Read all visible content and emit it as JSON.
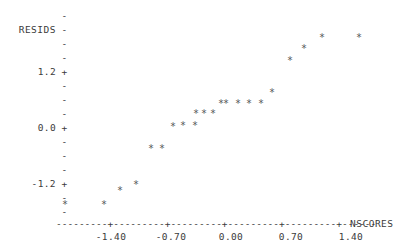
{
  "plot": {
    "y_axis_title": "RESIDS",
    "x_axis_title": "NSCORES",
    "y_tick_labels": [
      {
        "text": "1.2+",
        "value": 1.2
      },
      {
        "text": "0.0+",
        "value": 0.0
      },
      {
        "text": "-1.2+",
        "value": -1.2
      }
    ],
    "y_minor_tick_glyph": "-",
    "x_tick_labels": [
      "-1.40",
      "-0.70",
      "0.00",
      "0.70",
      "1.40"
    ],
    "x_axis_glyph_line": "---------+---------+---------+---------+---------+------",
    "x_tick_glyph": "+",
    "point_glyph": "*",
    "point_color": "#555555",
    "axis_color": "#3b3b3b",
    "background": "#ffffff",
    "n_points": 25
  },
  "chart_data": {
    "type": "scatter",
    "title": "",
    "subtitle": "",
    "xlabel": "NSCORES",
    "ylabel": "RESIDS",
    "xlim": [
      -2.1,
      2.1
    ],
    "ylim": [
      -2.3,
      2.1
    ],
    "xticks": [
      -1.4,
      -0.7,
      0.0,
      0.7,
      1.4
    ],
    "xticklabels": [
      "-1.40",
      "-0.70",
      "0.00",
      "0.70",
      "1.40"
    ],
    "yticks": [
      1.2,
      0.0,
      -1.2
    ],
    "yticklabels": [
      "1.2+",
      "0.0+",
      "-1.2+"
    ],
    "grid": false,
    "legend": null,
    "marker": "*",
    "series": [
      {
        "name": "residuals vs normal scores",
        "x": [
          -1.92,
          -1.46,
          -1.19,
          -1.0,
          -0.76,
          -0.62,
          -0.46,
          -0.36,
          -0.24,
          -0.16,
          -0.06,
          0.0,
          0.06,
          0.16,
          0.24,
          0.36,
          0.46,
          0.62,
          0.76,
          1.0,
          1.19,
          1.46,
          1.92
        ],
        "y": [
          -1.86,
          -1.86,
          -1.63,
          -1.5,
          -1.26,
          -1.26,
          -0.93,
          -0.9,
          -0.62,
          -0.6,
          -0.58,
          -0.56,
          -0.55,
          -0.53,
          -0.4,
          0.0,
          0.12,
          0.36,
          0.9,
          1.12,
          1.42,
          1.52,
          1.52
        ]
      }
    ],
    "points_px": [
      {
        "x": 65,
        "y": 204
      },
      {
        "x": 104,
        "y": 204
      },
      {
        "x": 120,
        "y": 190
      },
      {
        "x": 136,
        "y": 184
      },
      {
        "x": 151,
        "y": 148
      },
      {
        "x": 162,
        "y": 148
      },
      {
        "x": 173,
        "y": 126
      },
      {
        "x": 183,
        "y": 125
      },
      {
        "x": 195,
        "y": 125
      },
      {
        "x": 196,
        "y": 113
      },
      {
        "x": 204,
        "y": 113
      },
      {
        "x": 213,
        "y": 113
      },
      {
        "x": 221,
        "y": 103
      },
      {
        "x": 226,
        "y": 103
      },
      {
        "x": 238,
        "y": 103
      },
      {
        "x": 249,
        "y": 103
      },
      {
        "x": 261,
        "y": 103
      },
      {
        "x": 272,
        "y": 92
      },
      {
        "x": 290,
        "y": 60
      },
      {
        "x": 304,
        "y": 48
      },
      {
        "x": 322,
        "y": 37
      },
      {
        "x": 359,
        "y": 37
      }
    ]
  }
}
